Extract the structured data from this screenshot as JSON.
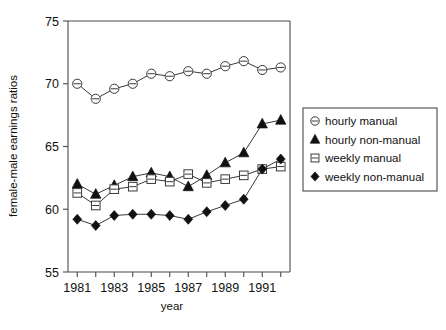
{
  "chart_data": {
    "type": "line",
    "title": "",
    "xlabel": "year",
    "ylabel": "female-male earnings ratios",
    "x": [
      1981,
      1982,
      1983,
      1984,
      1985,
      1986,
      1987,
      1988,
      1989,
      1990,
      1991,
      1992
    ],
    "xlim": [
      1980.5,
      1992.5
    ],
    "ylim": [
      55,
      75
    ],
    "yticks": [
      55,
      60,
      65,
      70,
      75
    ],
    "xticks": [
      1981,
      1982,
      1983,
      1984,
      1985,
      1986,
      1987,
      1988,
      1989,
      1990,
      1991,
      1992
    ],
    "xticklabels": [
      "1981",
      "",
      "1983",
      "",
      "1985",
      "",
      "1987",
      "",
      "1989",
      "",
      "1991",
      ""
    ],
    "yticklabels": [
      "55",
      "60",
      "65",
      "70",
      "75"
    ],
    "grid": false,
    "legend_position": "right-outside",
    "series": [
      {
        "name": "hourly manual",
        "marker": "circle-open-bar",
        "values": [
          70.0,
          68.8,
          69.6,
          70.0,
          70.8,
          70.6,
          71.0,
          70.8,
          71.4,
          71.8,
          71.1,
          71.3
        ]
      },
      {
        "name": "hourly non-manual",
        "marker": "triangle-filled",
        "values": [
          62.0,
          61.2,
          61.9,
          62.6,
          62.9,
          62.6,
          61.8,
          62.7,
          63.7,
          64.5,
          66.8,
          67.1
        ]
      },
      {
        "name": "weekly manual",
        "marker": "square-open-bar",
        "values": [
          61.3,
          60.3,
          61.6,
          61.8,
          62.4,
          62.2,
          62.8,
          62.1,
          62.4,
          62.7,
          63.2,
          63.4
        ]
      },
      {
        "name": "weekly non-manual",
        "marker": "diamond-filled",
        "values": [
          59.2,
          58.7,
          59.5,
          59.6,
          59.6,
          59.5,
          59.2,
          59.8,
          60.3,
          60.8,
          63.2,
          64.0
        ]
      }
    ]
  },
  "legend": {
    "items": [
      {
        "label": "hourly manual",
        "marker": "circle-open-bar"
      },
      {
        "label": "hourly non-manual",
        "marker": "triangle-filled"
      },
      {
        "label": "weekly manual",
        "marker": "square-open-bar"
      },
      {
        "label": "weekly non-manual",
        "marker": "diamond-filled"
      }
    ]
  },
  "colors": {
    "axis": "#4a4a4a",
    "line": "#3a3a3a",
    "marker_fill": "#111111",
    "marker_open": "#ffffff",
    "text": "#111111",
    "background": "#ffffff"
  }
}
